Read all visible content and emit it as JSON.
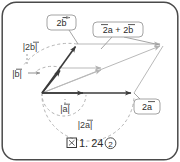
{
  "figure": {
    "caption": {
      "glyph": "図",
      "number": "1. 24",
      "circled_index": "②",
      "full": "図 1. 24 ②"
    },
    "frame": {
      "border_color": "#4a4a4a",
      "corner_radius": 14,
      "background": "#ffffff"
    },
    "colors": {
      "vector_dark": "#3b3b3b",
      "vector_light": "#b9b9b9",
      "dashed": "#b0b0b0",
      "callout_border": "#9a9a9a",
      "callout_fill": "#ffffff",
      "text": "#2b2b2b"
    },
    "callouts": [
      {
        "id": "callout-2b",
        "label": "2b⃗",
        "text": "2b",
        "x": 47,
        "y": 15,
        "w": 29,
        "h": 15
      },
      {
        "id": "callout-2a-plus-2b",
        "label": "2a⃗ + 2b⃗",
        "text": "2a + 2b",
        "x": 93,
        "y": 22,
        "w": 50,
        "h": 15
      },
      {
        "id": "callout-2a",
        "label": "2a⃗",
        "text": "2a",
        "x": 134,
        "y": 99,
        "w": 26,
        "h": 15
      }
    ],
    "magnitude_labels": [
      {
        "id": "label-abs-2b",
        "text": "|2b⃗|",
        "plain": "|2b|",
        "x": 17,
        "y": 46
      },
      {
        "id": "label-abs-b",
        "text": "|b⃗|",
        "plain": "|b|",
        "x": 8,
        "y": 73
      },
      {
        "id": "label-abs-a",
        "text": "|a⃗|",
        "plain": "|a|",
        "x": 58,
        "y": 100
      },
      {
        "id": "label-abs-2a",
        "text": "|2a⃗|",
        "plain": "|2a|",
        "x": 74,
        "y": 117
      }
    ],
    "points": {
      "origin": {
        "x": 42,
        "y": 93
      },
      "a": {
        "x": 86,
        "y": 93
      },
      "two_a": {
        "x": 134,
        "y": 93
      },
      "b": {
        "x": 62,
        "y": 68
      },
      "two_b": {
        "x": 77,
        "y": 44
      },
      "a_plus_b": {
        "x": 104,
        "y": 68
      },
      "two_a_2b": {
        "x": 163,
        "y": 44
      }
    },
    "vectors": [
      {
        "name": "vector-2b",
        "from": "origin",
        "to": "two_b",
        "style": "dark"
      },
      {
        "name": "vector-b",
        "from": "origin",
        "to": "b",
        "style": "dark"
      },
      {
        "name": "vector-a",
        "from": "origin",
        "to": "a",
        "style": "dark"
      },
      {
        "name": "vector-2a",
        "from": "origin",
        "to": "two_a",
        "style": "dark"
      },
      {
        "name": "vector-a-plus-b",
        "from": "origin",
        "to": "a_plus_b",
        "style": "light"
      },
      {
        "name": "vector-2a-plus-2b",
        "from": "origin",
        "to": "two_a_2b",
        "style": "light"
      },
      {
        "name": "edge-top",
        "from": "two_b",
        "to": "two_a_2b",
        "style": "light"
      },
      {
        "name": "edge-mid",
        "from": "b",
        "to": "a_plus_b",
        "style": "light"
      },
      {
        "name": "edge-right",
        "from": "two_a",
        "to": "two_a_2b",
        "style": "light"
      }
    ],
    "arcs": [
      {
        "name": "arc-abs-b",
        "label": "|b|"
      },
      {
        "name": "arc-abs-2b",
        "label": "|2b|"
      },
      {
        "name": "arc-abs-a",
        "label": "|a|"
      },
      {
        "name": "arc-abs-2a",
        "label": "|2a|"
      }
    ]
  }
}
